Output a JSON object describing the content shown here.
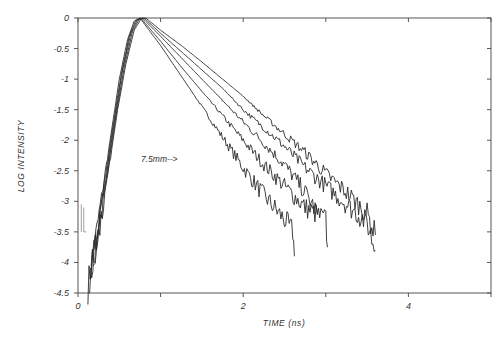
{
  "chart_data": {
    "type": "line",
    "title": "",
    "xlabel": "TIME (ns)",
    "ylabel": "LOG INTENSITY",
    "xlim": [
      0,
      5
    ],
    "ylim": [
      -4.5,
      0
    ],
    "x_ticks": [
      0,
      1,
      2,
      3,
      4,
      5
    ],
    "x_tick_labels": [
      "0",
      "",
      "2",
      "",
      "4",
      ""
    ],
    "y_ticks": [
      0,
      -0.5,
      -1,
      -1.5,
      -2,
      -2.5,
      -3,
      -3.5,
      -4,
      -4.5
    ],
    "y_tick_labels": [
      "0",
      "-0.5",
      "-1",
      "-1.5",
      "-2",
      "-2.5",
      "-3",
      "-3.5",
      "-4",
      "-4.5"
    ],
    "grid": false,
    "legend": null,
    "annotations": [
      {
        "text": "7.5mm-->",
        "x": 1.15,
        "y": -2.3,
        "points_to_series": "Curve 2"
      }
    ],
    "series": [
      {
        "name": "Curve 1",
        "x": [
          0.12,
          0.2,
          0.3,
          0.4,
          0.5,
          0.6,
          0.68,
          0.75,
          1.0,
          1.25,
          1.5,
          1.75,
          2.0,
          2.25,
          2.5,
          2.6,
          2.62
        ],
        "y": [
          -4.4,
          -3.7,
          -2.8,
          -1.9,
          -1.0,
          -0.35,
          -0.05,
          0.0,
          -0.45,
          -0.95,
          -1.45,
          -1.95,
          -2.45,
          -2.9,
          -3.3,
          -3.5,
          -3.9
        ]
      },
      {
        "name": "Curve 2",
        "x": [
          0.14,
          0.22,
          0.32,
          0.42,
          0.52,
          0.62,
          0.7,
          0.76,
          1.0,
          1.25,
          1.5,
          1.75,
          2.0,
          2.25,
          2.5,
          2.75,
          3.0,
          3.02
        ],
        "y": [
          -4.3,
          -3.6,
          -2.7,
          -1.8,
          -0.95,
          -0.3,
          -0.04,
          0.0,
          -0.38,
          -0.8,
          -1.2,
          -1.6,
          -2.0,
          -2.4,
          -2.75,
          -3.1,
          -3.3,
          -3.75
        ]
      },
      {
        "name": "Curve 3",
        "x": [
          0.15,
          0.24,
          0.34,
          0.44,
          0.54,
          0.64,
          0.72,
          0.78,
          1.0,
          1.25,
          1.5,
          1.75,
          2.0,
          2.25,
          2.5,
          2.75,
          2.9
        ],
        "y": [
          -4.2,
          -3.5,
          -2.6,
          -1.7,
          -0.85,
          -0.25,
          -0.03,
          0.0,
          -0.3,
          -0.65,
          -1.0,
          -1.35,
          -1.7,
          -2.05,
          -2.4,
          -2.85,
          -3.2
        ]
      },
      {
        "name": "Curve 4",
        "x": [
          0.16,
          0.26,
          0.36,
          0.46,
          0.56,
          0.66,
          0.74,
          0.8,
          1.0,
          1.25,
          1.5,
          1.75,
          2.0,
          2.25,
          2.5,
          2.75,
          3.0,
          3.25,
          3.5,
          3.6
        ],
        "y": [
          -4.1,
          -3.4,
          -2.5,
          -1.6,
          -0.8,
          -0.22,
          -0.02,
          0.0,
          -0.25,
          -0.55,
          -0.85,
          -1.15,
          -1.5,
          -1.8,
          -2.1,
          -2.45,
          -2.75,
          -3.05,
          -3.35,
          -3.8
        ]
      },
      {
        "name": "Curve 5",
        "x": [
          0.18,
          0.28,
          0.38,
          0.48,
          0.58,
          0.68,
          0.76,
          0.82,
          1.0,
          1.25,
          1.5,
          1.75,
          2.0,
          2.25,
          2.5,
          2.75,
          3.0,
          3.25,
          3.5,
          3.6
        ],
        "y": [
          -4.0,
          -3.3,
          -2.4,
          -1.5,
          -0.75,
          -0.2,
          -0.02,
          0.0,
          -0.2,
          -0.45,
          -0.72,
          -1.0,
          -1.28,
          -1.6,
          -1.9,
          -2.2,
          -2.55,
          -2.85,
          -3.2,
          -3.55
        ]
      }
    ]
  },
  "axes": {
    "x_title": "TIME (ns)",
    "y_title": "LOG INTENSITY"
  },
  "colors": {
    "ink": "#2a2a2a",
    "axis": "#555555",
    "background": "#ffffff"
  }
}
